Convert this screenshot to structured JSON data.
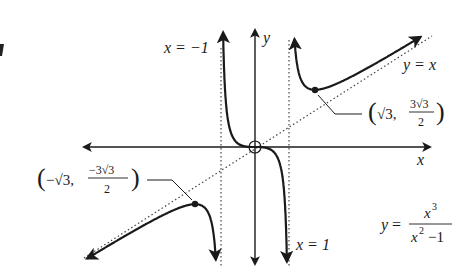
{
  "diagram": {
    "function_label": {
      "lhs": "y",
      "eq": "=",
      "numerator": "x",
      "numerator_exp": "3",
      "denominator_base": "x",
      "denominator_exp": "2",
      "denominator_rest": "−1"
    },
    "axes": {
      "x_label": "x",
      "y_label": "y"
    },
    "asymptotes": {
      "left": {
        "label": "x = −1",
        "value": -1
      },
      "right": {
        "label": "x = 1",
        "value": 1
      },
      "oblique": {
        "label": "y = x"
      }
    },
    "points": {
      "local_min": {
        "label_open": "(",
        "label_x": "√3,",
        "label_num": "3√3",
        "label_den": "2",
        "label_close": ")",
        "x": 1.732,
        "y": 2.598
      },
      "local_max": {
        "label_open": "(",
        "label_x": "−√3,",
        "label_num": "−3√3",
        "label_den": "2",
        "label_close": ")",
        "x": -1.732,
        "y": -2.598
      },
      "inflection": {
        "x": 0,
        "y": 0,
        "marker": "open-circle"
      }
    },
    "colors": {
      "curve": "#1a1a1a",
      "axis": "#333333",
      "dotted": "#333333"
    }
  }
}
